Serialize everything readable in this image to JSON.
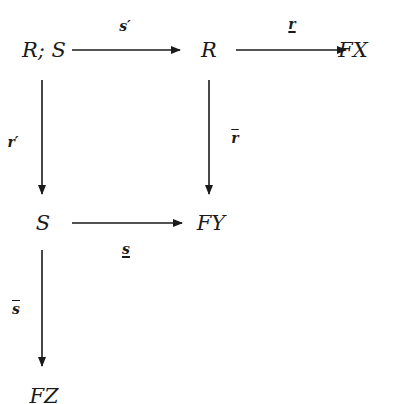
{
  "diagram": {
    "type": "commutative-diagram",
    "nodes": {
      "RS": "R; S",
      "R": "R",
      "FX": "FX",
      "S": "S",
      "FY": "FY",
      "FZ": "FZ"
    },
    "arrows": {
      "s_prime": {
        "label": "s′",
        "from": "R; S",
        "to": "R"
      },
      "r_underline": {
        "label": "r",
        "from": "R",
        "to": "FX",
        "decoration": "underline"
      },
      "r_prime": {
        "label": "r′",
        "from": "R; S",
        "to": "S"
      },
      "r_bar": {
        "label": "r",
        "from": "R",
        "to": "FY",
        "decoration": "overline"
      },
      "s_underline": {
        "label": "s",
        "from": "S",
        "to": "FY",
        "decoration": "underline"
      },
      "s_bar": {
        "label": "s",
        "from": "S",
        "to": "FZ",
        "decoration": "overline"
      }
    },
    "colors": {
      "ink": "#1a1a1a",
      "background": "#ffffff"
    }
  }
}
